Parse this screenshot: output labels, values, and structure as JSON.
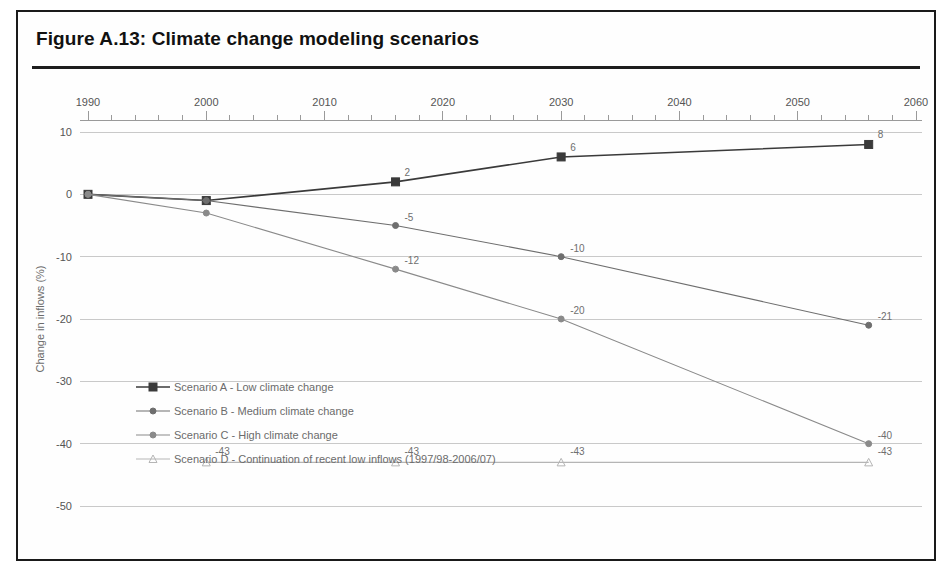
{
  "figure": {
    "title": "Figure A.13:  Climate change modeling scenarios"
  },
  "chart_data": {
    "type": "line",
    "title": "Figure A.13:  Climate change modeling scenarios",
    "xlabel": "",
    "ylabel": "Change in inflows (%)",
    "xlim": [
      1990,
      2060
    ],
    "ylim": [
      -50,
      10
    ],
    "xticks": [
      "1990",
      "2000",
      "2010",
      "2020",
      "2030",
      "2040",
      "2050",
      "2060"
    ],
    "xtick_values": [
      1990,
      2000,
      2010,
      2020,
      2030,
      2040,
      2050,
      2060
    ],
    "yticks": [
      "10",
      "0",
      "-10",
      "-20",
      "-30",
      "-40",
      "-50"
    ],
    "ytick_values": [
      10,
      0,
      -10,
      -20,
      -30,
      -40,
      -50
    ],
    "minor_xtick_interval": 2,
    "grid": "horizontal",
    "legend_position": "inside-lower-left",
    "series": [
      {
        "name": "Scenario A - Low climate change",
        "marker": "filled-square",
        "color": "#3a3a3a",
        "x": [
          1990,
          2000,
          2016,
          2030,
          2056
        ],
        "values": [
          0,
          -1,
          2,
          6,
          8
        ],
        "point_labels": [
          "",
          "",
          "2",
          "6",
          "8"
        ]
      },
      {
        "name": "Scenario B - Medium climate change",
        "marker": "small-dot",
        "color": "#6e6e6e",
        "x": [
          1990,
          2000,
          2016,
          2030,
          2056
        ],
        "values": [
          0,
          -1,
          -5,
          -10,
          -21
        ],
        "point_labels": [
          "",
          "",
          "-5",
          "-10",
          "-21"
        ]
      },
      {
        "name": "Scenario C - High climate change",
        "marker": "small-dot",
        "color": "#8a8a8a",
        "x": [
          1990,
          2000,
          2016,
          2030,
          2056
        ],
        "values": [
          0,
          -3,
          -12,
          -20,
          -40
        ],
        "point_labels": [
          "",
          "",
          "-12",
          "-20",
          "-40"
        ]
      },
      {
        "name": "Scenario D - Continuation of recent low inflows (1997/98-2006/07)",
        "marker": "small-triangle",
        "color": "#b5b5b5",
        "x": [
          2000,
          2016,
          2030,
          2056
        ],
        "values": [
          -43,
          -43,
          -43,
          -43
        ],
        "point_labels": [
          "-43",
          "-43",
          "-43",
          "-43"
        ]
      }
    ],
    "legend": [
      "Scenario A - Low climate change",
      "Scenario B - Medium climate change",
      "Scenario C - High climate change",
      "Scenario D - Continuation of recent low inflows (1997/98-2006/07)"
    ]
  }
}
